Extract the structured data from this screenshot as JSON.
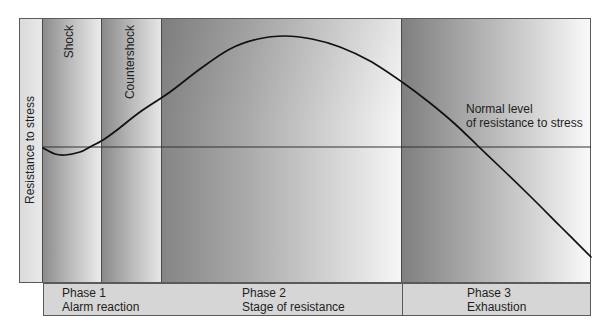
{
  "axis": {
    "y_label": "Resistance to stress"
  },
  "sub_columns": [
    {
      "label": "Shock"
    },
    {
      "label": "Countershock"
    }
  ],
  "reference_line": {
    "label_line1": "Normal level",
    "label_line2": "of resistance to stress",
    "y": 147
  },
  "phases": [
    {
      "name": "Phase 1",
      "stage": "Alarm reaction"
    },
    {
      "name": "Phase 2",
      "stage": "Stage of resistance"
    },
    {
      "name": "Phase 3",
      "stage": "Exhaustion"
    }
  ],
  "colors": {
    "curve": "#111111",
    "reference_line": "#333333",
    "phase_box": "#d6d6d6",
    "border": "#5a5a5a"
  },
  "curve": {
    "description": "Resistance to stress over time: brief dip below normal during shock, rise above normal through countershock, peak during stage of resistance, decline below normal during exhaustion",
    "points": [
      [
        43,
        148
      ],
      [
        55,
        154
      ],
      [
        65,
        155
      ],
      [
        80,
        152
      ],
      [
        90,
        147
      ],
      [
        103,
        140
      ],
      [
        117,
        130
      ],
      [
        140,
        112
      ],
      [
        170,
        92
      ],
      [
        200,
        69
      ],
      [
        230,
        49
      ],
      [
        258,
        39
      ],
      [
        285,
        36
      ],
      [
        312,
        39
      ],
      [
        340,
        47
      ],
      [
        370,
        61
      ],
      [
        402,
        82
      ],
      [
        430,
        103
      ],
      [
        455,
        124
      ],
      [
        478,
        146
      ],
      [
        500,
        167
      ],
      [
        530,
        196
      ],
      [
        560,
        226
      ],
      [
        591,
        257
      ]
    ]
  }
}
